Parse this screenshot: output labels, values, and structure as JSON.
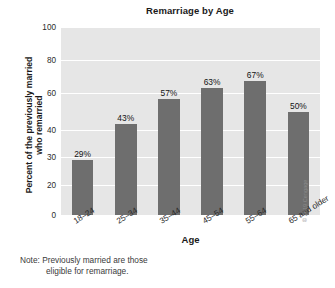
{
  "chart_data": {
    "type": "bar",
    "title": "Remarriage by Age",
    "xlabel": "Age",
    "ylabel_line1": "Percent of the previously married",
    "ylabel_line2": "who remarried",
    "categories": [
      "18–24",
      "25–34",
      "35–44",
      "45–54",
      "55–64",
      "65 and older"
    ],
    "values": [
      29,
      43,
      57,
      63,
      67,
      50
    ],
    "value_labels": [
      "29%",
      "43%",
      "57%",
      "63%",
      "67%",
      "50%"
    ],
    "yticks": [
      0,
      20,
      30,
      40,
      60,
      80,
      100
    ],
    "ytick_labels": [
      "0",
      "20",
      "30",
      "40",
      "60",
      "80",
      "100"
    ],
    "ytick_positions_px": [
      188,
      158,
      130,
      103,
      66,
      33,
      0
    ],
    "ylim": [
      0,
      100
    ],
    "grid": true,
    "gridline_color": "#ffffff",
    "legend": null,
    "bar_color": "#6e6e6e",
    "plot_background": "#e6e6e6",
    "figure_background": "#ffffff"
  },
  "annotations": {
    "note_line1": "Note: Previously married are those",
    "note_line2": "eligible for remarriage.",
    "credit": "© 2019 Cengage"
  }
}
